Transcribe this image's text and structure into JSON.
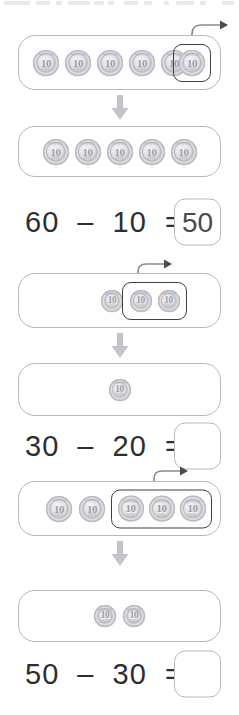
{
  "page": {
    "background_color": "#ffffff",
    "coin_label": "10",
    "coin_tick_top": "NIPPON",
    "coin_tick_bottom": "2021",
    "coin_color": "#c9c9ce",
    "tray_border_color": "#b9b9bd",
    "selection_border_color": "#3f3f44",
    "arrow_color": "#c4c4c8",
    "text_color": "#2e2e2e"
  },
  "problems": [
    {
      "id": "problem-1",
      "start_tray": {
        "name": "coin-tray-start-1",
        "total_coins": 6,
        "loose_coins": 5,
        "selected_coins": 1,
        "selection_label": "take-away-group"
      },
      "result_tray": {
        "name": "coin-tray-result-1",
        "total_coins": 5
      },
      "equation": {
        "minuend": "60",
        "minus_sign": "–",
        "subtrahend": "10",
        "equals_sign": "=",
        "text": "60  –  10  =",
        "answer": "50",
        "answer_filled": true
      }
    },
    {
      "id": "problem-2",
      "start_tray": {
        "name": "coin-tray-start-2",
        "total_coins": 3,
        "loose_coins": 1,
        "selected_coins": 2,
        "selection_label": "take-away-group"
      },
      "result_tray": {
        "name": "coin-tray-result-2",
        "total_coins": 1
      },
      "equation": {
        "minuend": "30",
        "minus_sign": "–",
        "subtrahend": "20",
        "equals_sign": "=",
        "text": "30  –  20  =",
        "answer": "",
        "answer_filled": false
      }
    },
    {
      "id": "problem-3",
      "start_tray": {
        "name": "coin-tray-start-3",
        "total_coins": 5,
        "loose_coins": 2,
        "selected_coins": 3,
        "selection_label": "take-away-group"
      },
      "result_tray": {
        "name": "coin-tray-result-3",
        "total_coins": 2
      },
      "equation": {
        "minuend": "50",
        "minus_sign": "–",
        "subtrahend": "30",
        "equals_sign": "=",
        "text": "50  –  30  =",
        "answer": "",
        "answer_filled": false
      }
    }
  ],
  "icons": {
    "down_arrow": "down-arrow-icon",
    "takeaway_arrow": "curved-takeaway-arrow-icon"
  }
}
